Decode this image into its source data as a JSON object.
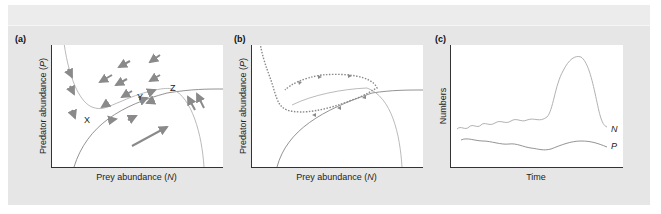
{
  "figure": {
    "panels": [
      {
        "id": "a",
        "label": "(a)",
        "ylabel": "Predator abundance (P)",
        "ylabel_text": "Predator abundance (",
        "ylabel_var": "P",
        "ylabel_end": ")",
        "xlabel_text": "Prey abundance (",
        "xlabel_var": "N",
        "xlabel_end": ")",
        "points": [
          {
            "name": "X"
          },
          {
            "name": "Y"
          },
          {
            "name": "Z"
          }
        ],
        "description": "Prey and predator zero-growth isoclines with direction-field arrows; points X, Y, Z on the prey isocline hump"
      },
      {
        "id": "b",
        "label": "(b)",
        "ylabel_text": "Predator abundance (",
        "ylabel_var": "P",
        "ylabel_end": ")",
        "xlabel_text": "Prey abundance (",
        "xlabel_var": "N",
        "xlabel_end": ")",
        "description": "Dotted trajectory spiraling into a stable limit cycle around the isocline intersection"
      },
      {
        "id": "c",
        "label": "(c)",
        "ylabel_text": "Numbers",
        "xlabel_text": "Time",
        "series": [
          {
            "name": "N"
          },
          {
            "name": "P"
          }
        ],
        "description": "Prey (N) and predator (P) numbers over time; N shows a large outbreak peak"
      }
    ],
    "colors": {
      "background_band": "#e6e6e6",
      "plot_bg": "#ffffff",
      "axis": "#333333",
      "curve": "#a8a8a8",
      "isocline": "#777777",
      "arrow": "#8a8a8a",
      "trajectory": "#8a8a8a",
      "text": "#222222"
    }
  }
}
